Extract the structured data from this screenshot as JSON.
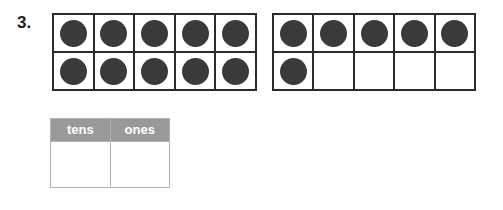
{
  "problem": {
    "number_label": "3."
  },
  "colors": {
    "counter_fill": "#3a3a3a",
    "frame_border": "#2b2b2b",
    "table_header_bg": "#999999",
    "table_header_text": "#ffffff",
    "table_border": "#b3b3b3",
    "page_background": "#ffffff"
  },
  "ten_frames": [
    {
      "name": "ten-frame-1",
      "columns": 5,
      "rows": 2,
      "filled_count": 10,
      "cells": [
        [
          "filled",
          "filled",
          "filled",
          "filled",
          "filled"
        ],
        [
          "filled",
          "filled",
          "filled",
          "filled",
          "filled"
        ]
      ]
    },
    {
      "name": "ten-frame-2",
      "columns": 5,
      "rows": 2,
      "filled_count": 6,
      "cells": [
        [
          "filled",
          "filled",
          "filled",
          "filled",
          "filled"
        ],
        [
          "filled",
          "empty",
          "empty",
          "empty",
          "empty"
        ]
      ]
    }
  ],
  "place_value_table": {
    "headers": [
      "tens",
      "ones"
    ],
    "rows": [
      [
        "",
        ""
      ]
    ]
  }
}
